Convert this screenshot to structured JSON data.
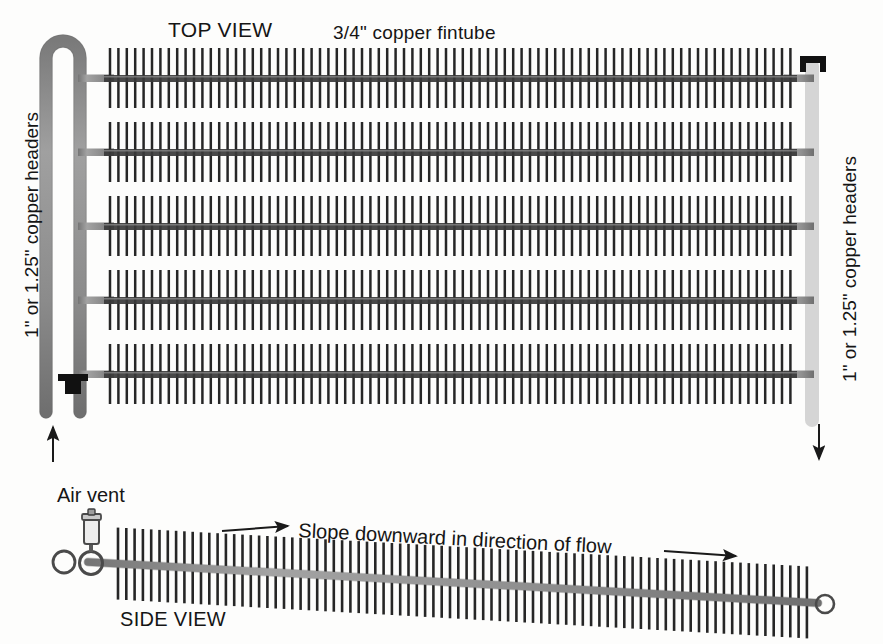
{
  "diagram": {
    "background_color": "#fdfdfc",
    "ink_color": "#1a1a1a",
    "pipe_color": "#8c8c8c",
    "pipe_edge_color": "#6e6e6e",
    "fin_color": "#262626",
    "clamp_color": "#111111"
  },
  "labels": {
    "top_view": "TOP VIEW",
    "fintube": "3/4\" copper fintube",
    "left_header": "1\" or 1.25\" copper headers",
    "right_header": "1\" or 1.25\" copper headers",
    "air_vent": "Air vent",
    "side_view": "SIDE VIEW",
    "slope": "Slope downward in direction of flow"
  },
  "top_view": {
    "rows": [
      {
        "index": 1,
        "y": 78
      },
      {
        "index": 2,
        "y": 152
      },
      {
        "index": 3,
        "y": 226
      },
      {
        "index": 4,
        "y": 300
      },
      {
        "index": 5,
        "y": 374
      }
    ],
    "fin_start_x": 110,
    "fin_end_x": 793,
    "fin_spacing": 8.4,
    "fin_half_height": 30,
    "tube_thickness": 7,
    "left_header": {
      "supply_x": 46,
      "return_x": 80,
      "top_y": 44,
      "bottom_y": 412,
      "width": 13,
      "u_bend": true,
      "cap_at_bottom": true
    },
    "right_header": {
      "x": 812,
      "top_y": 56,
      "bottom_y": 424,
      "width": 13,
      "cap_at_top": true
    },
    "flow_arrows": [
      {
        "name": "inlet-arrow",
        "direction": "up",
        "x": 53,
        "y_from": 462,
        "y_to": 424
      },
      {
        "name": "outlet-arrow",
        "direction": "down",
        "x": 819,
        "y_from": 424,
        "y_to": 462
      }
    ]
  },
  "side_view": {
    "tube_start": {
      "x": 90,
      "y": 562
    },
    "tube_end": {
      "x": 818,
      "y": 603
    },
    "fin_start_x": 118,
    "fin_end_x": 810,
    "fin_spacing": 8.3,
    "fin_half_height": 36,
    "end_cap_circle": {
      "x": 824,
      "y": 604,
      "r": 9
    },
    "air_vent": {
      "body": {
        "x": 88,
        "y": 516,
        "w": 15,
        "h": 30
      },
      "fitting": {
        "x": 90,
        "y": 562,
        "r": 11
      },
      "side_circle": {
        "x": 64,
        "y": 562,
        "r": 11
      }
    },
    "slope_arrows": [
      {
        "name": "slope-arrow-left",
        "x_from": 222,
        "y_from": 528,
        "x_to": 292,
        "y_to": 524
      },
      {
        "name": "slope-arrow-right",
        "x_from": 664,
        "y_from": 551,
        "x_to": 742,
        "y_to": 555
      }
    ]
  }
}
